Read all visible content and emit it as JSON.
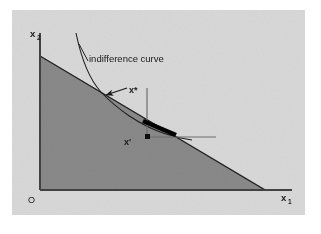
{
  "figure": {
    "kind": "economics-diagram",
    "title_text": "indifference curve",
    "panel_color": "#d9d9d9",
    "page_color": "#ffffff",
    "budget_set_color": "#8a8a8a",
    "line_color": "#1f1f1f",
    "highlight_color": "#000000",
    "guide_color": "#6f6f6f"
  },
  "axes": {
    "y_label": "x",
    "y_label_sub": "2",
    "x_label": "x",
    "x_label_sub": "1",
    "origin_label": "O"
  },
  "annotations": {
    "curve_label": "indifference curve",
    "optimum_label": "x*",
    "interior_label": "x'"
  },
  "geometry": {
    "panel": {
      "x": 12,
      "y": 10,
      "width": 293,
      "height": 205
    },
    "origin": {
      "x": 40,
      "y": 190
    },
    "y_axis_top": {
      "x": 40,
      "y": 33
    },
    "x_axis_right": {
      "x": 292,
      "y": 190
    },
    "budget_line": {
      "x1": 40,
      "y1": 56,
      "x2": 265,
      "y2": 190
    },
    "tangency_point": {
      "x": 100,
      "y": 92
    },
    "interior_point": {
      "x": 148,
      "y": 137
    },
    "bundle_segment": {
      "x1": 143,
      "y1": 121,
      "x2": 176,
      "y2": 135
    },
    "vertical_guide": {
      "x": 147,
      "y1": 88,
      "y2": 138
    },
    "horizontal_guide": {
      "x1": 148,
      "y1": 137,
      "x2": 216,
      "y2": 137
    },
    "curve_label_pos": {
      "x": 89,
      "y": 59
    },
    "optimum_label_pos": {
      "x": 129,
      "y": 92
    },
    "interior_label_pos": {
      "x": 126,
      "y": 143
    },
    "leader_arrow": {
      "x1": 126,
      "y1": 89,
      "x2": 105,
      "y2": 96
    },
    "curve_leader": {
      "x1": 88,
      "y1": 62,
      "x2": 80,
      "y2": 48
    }
  }
}
